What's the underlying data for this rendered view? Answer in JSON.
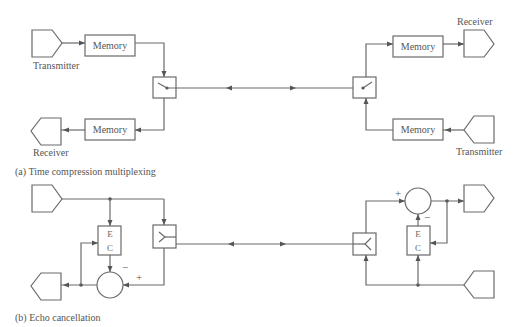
{
  "diagram": {
    "panel_a": {
      "caption": "(a) Time compression multiplexing",
      "left": {
        "transmitter_label": "Transmitter",
        "receiver_label": "Receiver",
        "memory_top_label": "Memory",
        "memory_bottom_label": "Memory"
      },
      "right": {
        "receiver_label": "Receiver",
        "transmitter_label": "Transmitter",
        "memory_top_label": "Memory",
        "memory_bottom_label": "Memory"
      }
    },
    "panel_b": {
      "caption": "(b) Echo cancellation",
      "left": {
        "ec_top": "E",
        "ec_bottom": "C",
        "minus_sign": "−",
        "plus_sign": "+"
      },
      "right": {
        "ec_top": "E",
        "ec_bottom": "C",
        "minus_sign": "−",
        "plus_sign": "+"
      }
    },
    "colors": {
      "line": "#6a6a6a",
      "text": "#555555",
      "background": "#ffffff"
    }
  }
}
